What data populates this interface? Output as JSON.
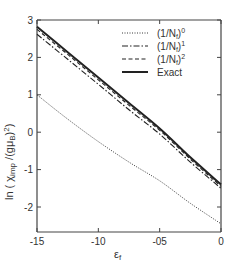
{
  "chart_data": {
    "type": "line",
    "title": "",
    "xlabel": "ε_f",
    "ylabel": "ln ( χ_imp / (gμ_B)^2 )",
    "xlim": [
      -1.5,
      0
    ],
    "ylim": [
      -2.67,
      3
    ],
    "grid": false,
    "legend_position": "upper right",
    "x_ticks": [
      -1.5,
      -1.0,
      -0.5,
      0
    ],
    "x_tick_labels": [
      "-15",
      "-10",
      "-05",
      "0"
    ],
    "y_ticks": [
      3,
      2,
      1,
      0,
      -1,
      -2
    ],
    "y_tick_labels": [
      "3",
      "2",
      "1",
      "0",
      "-1",
      "-2"
    ],
    "x": [
      -1.5,
      -1.25,
      -1.0,
      -0.75,
      -0.5,
      -0.25,
      0
    ],
    "series": [
      {
        "name": "(1/N_f)^0",
        "style": "dotted",
        "values": [
          1.0,
          0.35,
          -0.25,
          -0.8,
          -1.3,
          -1.9,
          -2.45
        ]
      },
      {
        "name": "(1/N_f)^1",
        "style": "dash-dot",
        "values": [
          2.62,
          1.95,
          1.28,
          0.6,
          -0.05,
          -0.8,
          -1.5
        ]
      },
      {
        "name": "(1/N_f)^2",
        "style": "dashed",
        "values": [
          2.75,
          2.08,
          1.4,
          0.72,
          0.05,
          -0.72,
          -1.45
        ]
      },
      {
        "name": "Exact",
        "style": "solid",
        "values": [
          2.82,
          2.14,
          1.46,
          0.78,
          0.1,
          -0.67,
          -1.4
        ]
      }
    ]
  },
  "legend": {
    "items": [
      {
        "label_base": "(1/N",
        "label_sub": "f",
        "label_close": ")",
        "label_sup": "0"
      },
      {
        "label_base": "(1/N",
        "label_sub": "f",
        "label_close": ")",
        "label_sup": "1"
      },
      {
        "label_base": "(1/N",
        "label_sub": "f",
        "label_close": ")",
        "label_sup": "2"
      },
      {
        "label_base": "Exact",
        "label_sub": "",
        "label_close": "",
        "label_sup": ""
      }
    ]
  },
  "axes": {
    "y_title_main": "ln ( χ",
    "y_title_sub": "imp",
    "y_title_mid": " /(gμ",
    "y_title_sub2": "B",
    "y_title_end": ")",
    "y_title_sup": "2",
    "y_title_close": ")",
    "x_title_main": "ε",
    "x_title_sub": "f"
  }
}
